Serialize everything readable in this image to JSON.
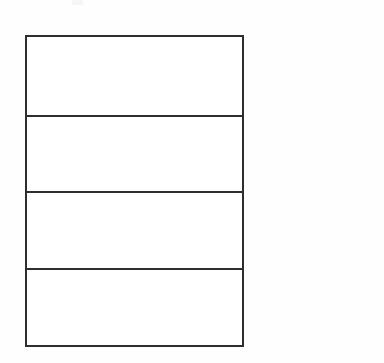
{
  "document": {
    "kind": "blank-form-table",
    "background_color": "#fefefe",
    "border_color": "#2e2e2e",
    "cell_background": "#ffffff"
  },
  "table": {
    "label": "blank form grid",
    "columns": 1,
    "rows": [
      {
        "index": 1,
        "text": ""
      },
      {
        "index": 2,
        "text": ""
      },
      {
        "index": 3,
        "text": ""
      },
      {
        "index": 4,
        "text": ""
      }
    ]
  },
  "artifacts": {
    "scan_smudge": ""
  }
}
